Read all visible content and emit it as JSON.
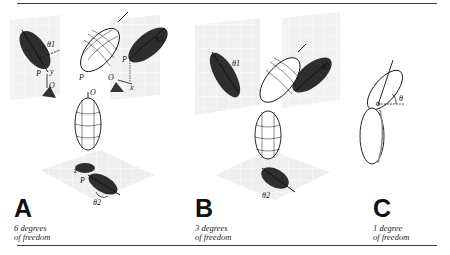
{
  "figure": {
    "panels": [
      {
        "letter": "A",
        "caption_line1": "6 degrees",
        "caption_line2": "of freedom",
        "labels": {
          "theta1": "θ1",
          "theta2": "θ2",
          "theta3": "θ3",
          "P": "P",
          "O": "O",
          "x": "x",
          "y": "y",
          "z": "z"
        }
      },
      {
        "letter": "B",
        "caption_line1": "3 degrees",
        "caption_line2": "of freedom",
        "labels": {
          "theta1": "θ1",
          "theta2": "θ2",
          "theta3": "θ3"
        }
      },
      {
        "letter": "C",
        "caption_line1": "1 degree",
        "caption_line2": "of freedom",
        "labels": {
          "theta": "θ"
        }
      }
    ],
    "colors": {
      "shadow": "#2e2e2e",
      "grid_plane": "#ececec",
      "grid_line": "#ffffff",
      "outline": "#111111"
    }
  }
}
